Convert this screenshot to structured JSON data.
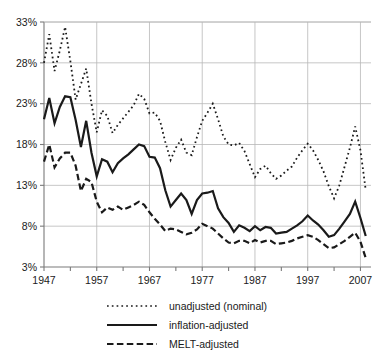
{
  "chart_data": {
    "type": "line",
    "title": "",
    "subtitle": "",
    "xlabel": "",
    "ylabel": "",
    "xlim": [
      1947,
      2009
    ],
    "ylim": [
      3,
      33
    ],
    "yticks": [
      3,
      8,
      13,
      18,
      23,
      28,
      33
    ],
    "ytick_labels": [
      "3%",
      "8%",
      "13%",
      "18%",
      "23%",
      "28%",
      "33%"
    ],
    "xticks": [
      1947,
      1957,
      1967,
      1977,
      1987,
      1997,
      2007
    ],
    "xtick_labels": [
      "1947",
      "1957",
      "1967",
      "1977",
      "1987",
      "1997",
      "2007"
    ],
    "minor_xticks": [
      1952,
      1962,
      1972,
      1982,
      1992,
      2002
    ],
    "grid": true,
    "grid_color": "#b8b8b8",
    "axis_color": "#7a7a7a",
    "legend_position": "below",
    "x": [
      1947,
      1948,
      1949,
      1950,
      1951,
      1952,
      1953,
      1954,
      1955,
      1956,
      1957,
      1958,
      1959,
      1960,
      1961,
      1962,
      1963,
      1964,
      1965,
      1966,
      1967,
      1968,
      1969,
      1970,
      1971,
      1972,
      1973,
      1974,
      1975,
      1976,
      1977,
      1978,
      1979,
      1980,
      1981,
      1982,
      1983,
      1984,
      1985,
      1986,
      1987,
      1988,
      1989,
      1990,
      1991,
      1992,
      1993,
      1994,
      1995,
      1996,
      1997,
      1998,
      1999,
      2000,
      2001,
      2002,
      2003,
      2004,
      2005,
      2006,
      2007,
      2008
    ],
    "series": [
      {
        "name": "unadjusted (nominal)",
        "style": "dotted",
        "color": "#1a1a1a",
        "values": [
          28.0,
          31.5,
          27.0,
          29.5,
          32.4,
          28.2,
          23.5,
          25.4,
          27.3,
          23.0,
          19.5,
          22.2,
          21.5,
          19.4,
          20.4,
          21.2,
          22.0,
          22.8,
          24.2,
          23.6,
          21.8,
          21.9,
          20.9,
          18.3,
          16.1,
          17.6,
          18.6,
          17.0,
          16.7,
          18.9,
          20.9,
          21.9,
          23.0,
          21.1,
          19.0,
          18.0,
          17.9,
          18.2,
          17.2,
          15.6,
          14.0,
          15.0,
          15.4,
          14.5,
          13.8,
          14.2,
          14.8,
          15.3,
          16.4,
          17.3,
          18.1,
          17.3,
          16.1,
          14.7,
          12.9,
          11.4,
          13.0,
          15.3,
          17.6,
          20.2,
          17.3,
          12.4
        ]
      },
      {
        "name": "inflation-adjusted",
        "style": "solid",
        "color": "#1a1a1a",
        "values": [
          21.1,
          23.7,
          20.6,
          22.6,
          23.9,
          23.8,
          21.0,
          17.7,
          20.9,
          17.0,
          14.1,
          16.2,
          15.9,
          14.6,
          15.7,
          16.3,
          16.8,
          17.4,
          18.0,
          17.8,
          16.5,
          16.4,
          15.1,
          12.4,
          10.4,
          11.2,
          12.0,
          11.2,
          9.5,
          11.2,
          12.0,
          12.1,
          12.3,
          10.2,
          9.1,
          8.4,
          7.3,
          8.1,
          7.8,
          7.4,
          8.0,
          7.5,
          7.9,
          7.8,
          7.1,
          7.2,
          7.3,
          7.7,
          8.1,
          8.6,
          9.3,
          8.7,
          8.2,
          7.5,
          6.7,
          6.9,
          7.7,
          8.6,
          9.5,
          11.0,
          9.0,
          6.8
        ]
      },
      {
        "name": "MELT-adjusted",
        "style": "dashed",
        "color": "#1a1a1a",
        "values": [
          15.9,
          18.0,
          15.2,
          16.3,
          17.0,
          17.0,
          15.4,
          12.3,
          13.8,
          13.4,
          11.0,
          9.7,
          10.3,
          10.0,
          10.4,
          10.0,
          10.3,
          10.6,
          11.0,
          10.6,
          9.7,
          8.9,
          8.2,
          7.4,
          7.7,
          7.6,
          7.3,
          7.0,
          7.2,
          7.6,
          8.3,
          8.0,
          7.7,
          7.1,
          6.5,
          6.0,
          5.9,
          6.2,
          6.2,
          5.9,
          6.3,
          6.0,
          6.2,
          6.2,
          5.8,
          5.9,
          6.0,
          6.2,
          6.5,
          6.7,
          6.9,
          6.7,
          6.3,
          5.8,
          5.3,
          5.4,
          5.8,
          6.2,
          6.7,
          7.2,
          6.1,
          4.1
        ]
      }
    ]
  },
  "legend": {
    "items": [
      {
        "label": "unadjusted (nominal)",
        "style": "dotted"
      },
      {
        "label": "inflation-adjusted",
        "style": "solid"
      },
      {
        "label": "MELT-adjusted",
        "style": "dashed"
      }
    ]
  }
}
